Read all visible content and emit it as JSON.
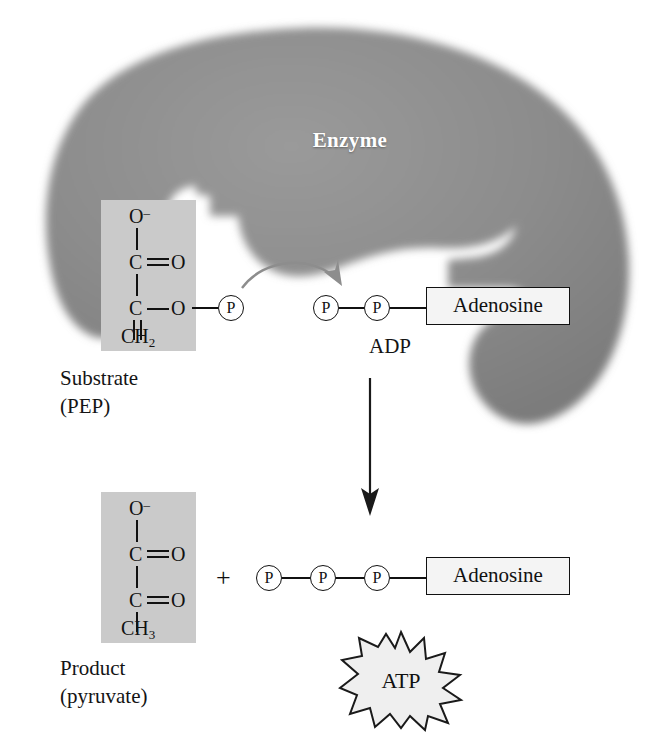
{
  "figure": {
    "background_color": "#ffffff"
  },
  "enzyme": {
    "label": "Enzyme",
    "fill_color": "#8a8a8a",
    "label_color": "#ffffff"
  },
  "colors": {
    "molecule_box": "#cacaca",
    "ink": "#111111",
    "arrow_curved": "#8d8d8d",
    "arrow_vertical": "#1a1a1a",
    "adenosine_box": "#f4f4f4",
    "starburst_fill": "#efefef"
  },
  "substrate": {
    "caption_line1": "Substrate",
    "caption_line2": "(PEP)",
    "atoms": {
      "top_oxygen": "O",
      "top_oxygen_charge": "–",
      "carbon1": "C",
      "carbonyl_oxygen": "O",
      "carbon2": "C",
      "ester_oxygen": "O",
      "methylene": "CH",
      "methylene_sub": "2"
    },
    "phosphate_label": "P"
  },
  "product": {
    "caption_line1": "Product",
    "caption_line2": "(pyruvate)",
    "atoms": {
      "top_oxygen": "O",
      "top_oxygen_charge": "–",
      "carbon1": "C",
      "carbonyl_oxygen1": "O",
      "carbon2": "C",
      "carbonyl_oxygen2": "O",
      "methyl": "CH",
      "methyl_sub": "3"
    }
  },
  "adp": {
    "label": "ADP",
    "adenosine_label": "Adenosine",
    "phosphate_label": "P",
    "phosphate_count": 2
  },
  "atp": {
    "label": "ATP",
    "adenosine_label": "Adenosine",
    "phosphate_label": "P",
    "phosphate_count": 3
  },
  "operators": {
    "plus": "+"
  },
  "arrows": {
    "phosphate_transfer": "curved-transfer-arrow",
    "reaction": "down-arrow"
  }
}
